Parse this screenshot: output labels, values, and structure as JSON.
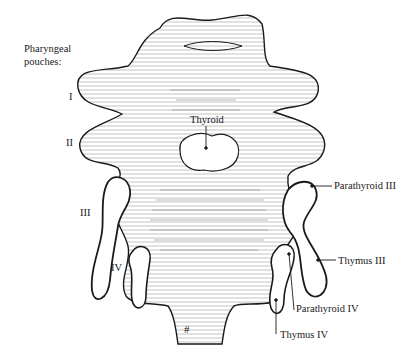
{
  "title": {
    "line1": "Pharyngeal",
    "line2": "pouches:"
  },
  "pouch_numerals": [
    {
      "label": "I"
    },
    {
      "label": "II"
    },
    {
      "label": "III"
    },
    {
      "label": "IV"
    }
  ],
  "structures": {
    "thyroid": "Thyroid",
    "parathyroid_iii": "Parathyroid III",
    "thymus_iii": "Thymus III",
    "parathyroid_iv": "Parathyroid IV",
    "thymus_iv": "Thymus IV"
  },
  "colors": {
    "ink": "#1a1a1a",
    "background": "#ffffff"
  }
}
